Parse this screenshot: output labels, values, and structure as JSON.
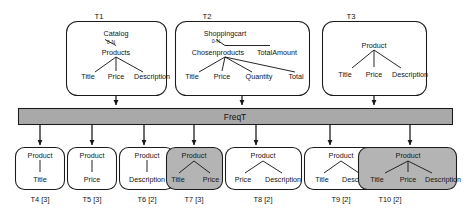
{
  "figure": {
    "colors": {
      "shaded_fill": "#b4b4b4",
      "plain_fill": "#ffffff",
      "bar_fill": "#a9a9a9",
      "stroke": "#1b1b1b",
      "background": "#ffffff"
    }
  },
  "process": {
    "label": "FreqT"
  },
  "input_trees": [
    {
      "id": "t1",
      "label": "T1",
      "root": "Catalog",
      "cardinality": "0-N",
      "mid": "Products",
      "leaves": [
        "Title",
        "Price",
        "Description"
      ],
      "shaded": false
    },
    {
      "id": "t2",
      "label": "T2",
      "root": "Shoppingcart",
      "cardinality": "0-N",
      "mid": "Chosenproducts",
      "mid2": "TotalAmount",
      "leaves": [
        "Title",
        "Price",
        "Quantity",
        "Total"
      ],
      "shaded": false
    },
    {
      "id": "t3",
      "label": "T3",
      "root": "Product",
      "leaves": [
        "Title",
        "Price",
        "Description"
      ],
      "shaded": false
    }
  ],
  "output_trees": [
    {
      "id": "t4",
      "label": "T4 [3]",
      "support": 3,
      "root": "Product",
      "leaves": [
        "Title"
      ],
      "shaded": false
    },
    {
      "id": "t5",
      "label": "T5 [3]",
      "support": 3,
      "root": "Product",
      "leaves": [
        "Price"
      ],
      "shaded": false
    },
    {
      "id": "t6",
      "label": "T6 [2]",
      "support": 2,
      "root": "Product",
      "leaves": [
        "Description"
      ],
      "shaded": false
    },
    {
      "id": "t7",
      "label": "T7 [3]",
      "support": 3,
      "root": "Product",
      "leaves": [
        "Title",
        "Price"
      ],
      "shaded": true
    },
    {
      "id": "t8",
      "label": "T8 [2]",
      "support": 2,
      "root": "Product",
      "leaves": [
        "Price",
        "Description"
      ],
      "shaded": false
    },
    {
      "id": "t9",
      "label": "T9 [2]",
      "support": 2,
      "root": "Product",
      "leaves": [
        "Title",
        "Description"
      ],
      "shaded": false
    },
    {
      "id": "t10",
      "label": "T10 [2]",
      "support": 2,
      "root": "Product",
      "leaves": [
        "Title",
        "Price",
        "Description"
      ],
      "shaded": true
    }
  ]
}
